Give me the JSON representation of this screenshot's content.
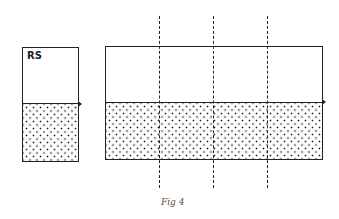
{
  "figure": {
    "left_box_label": "RS",
    "caption": "Fig 4",
    "dashed_lines_count": 3,
    "line_color": "#222222",
    "fill_pattern": "stipple"
  }
}
